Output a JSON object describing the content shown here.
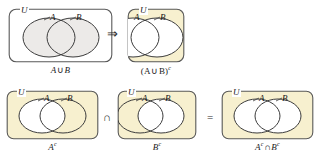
{
  "figure": {
    "universe_label": "U",
    "set_labels": {
      "a": "A",
      "b": "B"
    },
    "colors": {
      "shade_gray": "#eceae8",
      "shade_yellow": "#f7f0cf",
      "outline": "#3c3c3c",
      "box_outline": "#555555",
      "text": "#1a1a1a",
      "background": "#ffffff"
    },
    "panels": [
      {
        "id": "a-union-b",
        "universe_label": "U",
        "label_a": "A",
        "label_b": "B",
        "caption_main": "A",
        "caption_op": "∪",
        "caption_tail": "B",
        "caption_sup": "",
        "caption_full": "A ∪ B",
        "shaded_region": "both-circles",
        "shade_color": "#eceae8"
      },
      {
        "id": "a-union-b-complement",
        "universe_label": "U",
        "label_a": "A",
        "label_b": "B",
        "caption_main": "(A",
        "caption_op": "∪",
        "caption_tail": "B)",
        "caption_sup": "c",
        "caption_full": "(A ∪ B)c",
        "shaded_region": "outside-circles",
        "shade_color": "#f7f0cf"
      },
      {
        "id": "a-complement",
        "universe_label": "U",
        "label_a": "A",
        "label_b": "B",
        "caption_main": "A",
        "caption_op": "",
        "caption_tail": "",
        "caption_sup": "c",
        "caption_full": "Ac",
        "shaded_region": "outside-a",
        "shade_color": "#f7f0cf"
      },
      {
        "id": "b-complement",
        "universe_label": "U",
        "label_a": "A",
        "label_b": "B",
        "caption_main": "B",
        "caption_op": "",
        "caption_tail": "",
        "caption_sup": "c",
        "caption_full": "Bc",
        "shaded_region": "outside-b",
        "shade_color": "#f7f0cf"
      },
      {
        "id": "a-complement-intersect-b-complement",
        "universe_label": "U",
        "label_a": "A",
        "label_b": "B",
        "caption_main": "A",
        "caption_sup": "c",
        "caption_op": "∩",
        "caption_tail": "B",
        "caption_tail_sup": "c",
        "caption_full": "Ac ∩ Bc",
        "shaded_region": "outside-circles",
        "shade_color": "#f7f0cf"
      }
    ],
    "operators": {
      "arrow": "⇒",
      "intersection": "∩",
      "equals": "="
    }
  }
}
